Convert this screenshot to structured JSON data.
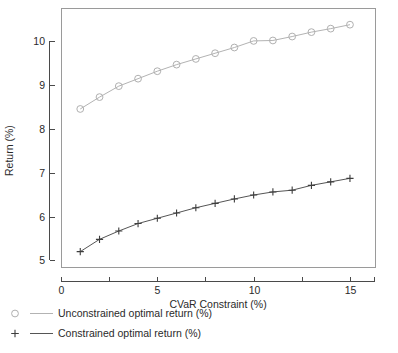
{
  "chart_data": {
    "type": "line",
    "title": "",
    "xlabel": "CVaR Constraint (%)",
    "ylabel": "Return (%)",
    "xlim": [
      0,
      16.3
    ],
    "ylim": [
      4.85,
      10.75
    ],
    "xticks": [
      0,
      5,
      10,
      15
    ],
    "xticklabels": [
      "0",
      "5",
      "10",
      "15"
    ],
    "xminorticks": [
      2.5,
      7.5,
      12.5
    ],
    "yticks": [
      5,
      6,
      7,
      8,
      9,
      10
    ],
    "yticklabels": [
      "5",
      "6",
      "7",
      "8",
      "9",
      "10"
    ],
    "grid": false,
    "legend_position": "below-outside",
    "x": [
      1,
      2,
      3,
      4,
      5,
      6,
      7,
      8,
      9,
      10,
      11,
      12,
      13,
      14,
      15
    ],
    "series": [
      {
        "name": "Unconstrained optimal return (%)",
        "marker": "circle",
        "color": "#b0b0b0",
        "values": [
          8.45,
          8.72,
          8.97,
          9.14,
          9.31,
          9.46,
          9.59,
          9.72,
          9.85,
          10.0,
          10.01,
          10.1,
          10.2,
          10.28,
          10.37
        ]
      },
      {
        "name": "Constrained optimal return (%)",
        "marker": "plus",
        "color": "#3d3d3d",
        "values": [
          5.2,
          5.48,
          5.67,
          5.84,
          5.96,
          6.08,
          6.2,
          6.3,
          6.4,
          6.49,
          6.56,
          6.6,
          6.71,
          6.79,
          6.87
        ]
      }
    ]
  },
  "legend": {
    "entries": [
      {
        "label": "Unconstrained optimal return (%)",
        "marker": "circle-icon"
      },
      {
        "label": "Constrained optimal return (%)",
        "marker": "plus-icon"
      }
    ]
  }
}
